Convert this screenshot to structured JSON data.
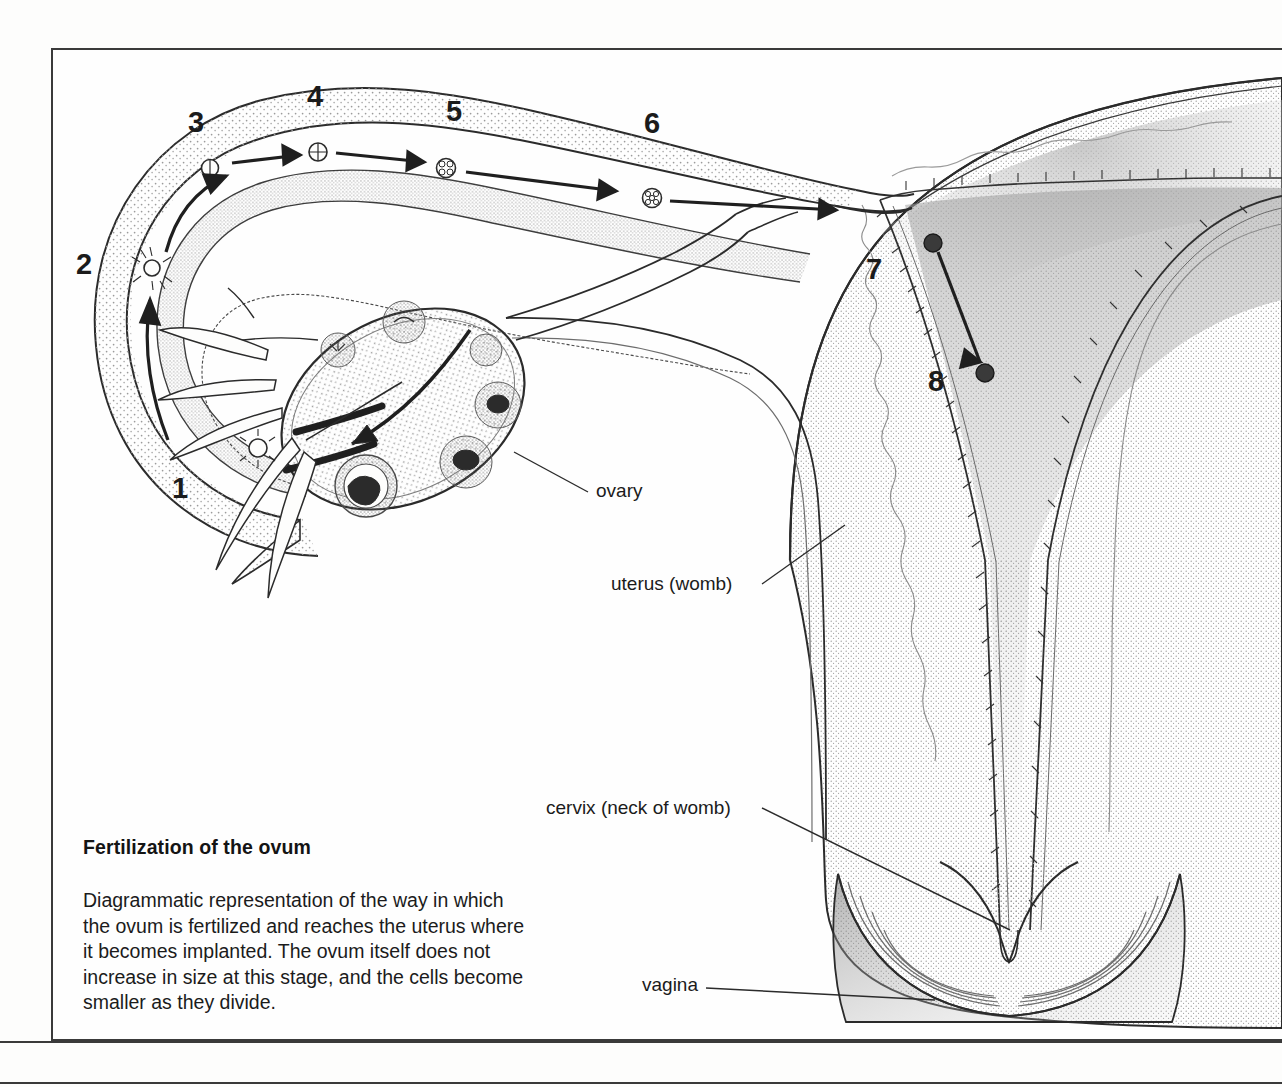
{
  "figure": {
    "title": "Fertilization of the ovum",
    "caption_lines": [
      "Diagrammatic representation of the way in which",
      "the ovum is fertilized and reaches the uterus where",
      "it becomes implanted. The ovum itself does not",
      "increase in size at this stage, and the cells become",
      "smaller as they divide."
    ],
    "caption_full": "Diagrammatic representation of the way in which the ovum is fertilized and reaches the uterus where it becomes implanted. The ovum itself does not increase in size at this stage, and the cells become smaller as they divide."
  },
  "stage_numbers": [
    {
      "id": "stage-1",
      "label": "1",
      "x": 172,
      "y": 474,
      "meaning": "ovum released from ovary at fimbriae"
    },
    {
      "id": "stage-2",
      "label": "2",
      "x": 76,
      "y": 250,
      "meaning": "fertilization by sperm"
    },
    {
      "id": "stage-3",
      "label": "3",
      "x": 188,
      "y": 108,
      "meaning": "two-cell stage"
    },
    {
      "id": "stage-4",
      "label": "4",
      "x": 307,
      "y": 82,
      "meaning": "four-cell stage"
    },
    {
      "id": "stage-5",
      "label": "5",
      "x": 446,
      "y": 97,
      "meaning": "morula"
    },
    {
      "id": "stage-6",
      "label": "6",
      "x": 644,
      "y": 109,
      "meaning": "late morula travelling to uterus"
    },
    {
      "id": "stage-7",
      "label": "7",
      "x": 866,
      "y": 255,
      "meaning": "blastocyst enters uterine cavity"
    },
    {
      "id": "stage-8",
      "label": "8",
      "x": 928,
      "y": 367,
      "meaning": "implantation in uterine wall"
    }
  ],
  "annotations": [
    {
      "id": "label-ovary",
      "text": "ovary",
      "x": 596,
      "y": 491,
      "leader": {
        "x1": 588,
        "y1": 492,
        "x2": 514,
        "y2": 452
      }
    },
    {
      "id": "label-uterus",
      "text": "uterus (womb)",
      "x": 611,
      "y": 584,
      "leader": {
        "x1": 762,
        "y1": 584,
        "x2": 845,
        "y2": 525
      }
    },
    {
      "id": "label-cervix",
      "text": "cervix (neck of womb)",
      "x": 546,
      "y": 805,
      "leader": {
        "x1": 762,
        "y1": 808,
        "x2": 1010,
        "y2": 930
      }
    },
    {
      "id": "label-vagina",
      "text": "vagina",
      "x": 642,
      "y": 983,
      "leader": {
        "x1": 706,
        "y1": 988,
        "x2": 935,
        "y2": 1000
      }
    }
  ],
  "colors": {
    "ink": "#1b1b1b",
    "frame": "#3a3a3a",
    "paper": "#fdfdfc",
    "tissue_fill": "#fbfbfa",
    "stipple": "#8e8e8e",
    "shade": "#9a9a9a"
  },
  "diagram": {
    "type": "anatomical-illustration",
    "structures": [
      "fallopian tube",
      "fimbriae",
      "ovary",
      "uterus",
      "endometrium",
      "cervix",
      "vagina"
    ],
    "flow_direction": "ovary -> fimbriae -> fallopian tube -> uterine cavity -> endometrial implantation"
  }
}
